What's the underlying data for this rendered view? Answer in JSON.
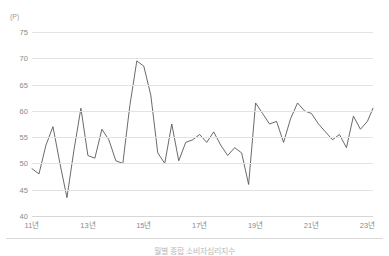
{
  "figure": {
    "caption": "월별 종합 소비자심리지수",
    "background": "#ffffff"
  },
  "axis": {
    "y_unit_label": "(P)",
    "y_ticks": [
      "75",
      "70",
      "65",
      "60",
      "55",
      "50",
      "45",
      "40"
    ],
    "x_ticks": [
      "11년",
      "13년",
      "15년",
      "17년",
      "19년",
      "21년",
      "23년"
    ]
  },
  "colors": {
    "line": "#595959",
    "grid": "#e3e3e3",
    "tick_text": "#8a8a8a",
    "unit_text": "#9a9a9a"
  },
  "chart_data": {
    "type": "line",
    "title": "",
    "xlabel": "",
    "ylabel": "(P)",
    "ylim": [
      40,
      75
    ],
    "xlim": [
      2011.0,
      2023.2
    ],
    "grid": true,
    "legend": "none",
    "y_ticks": [
      40,
      45,
      50,
      55,
      60,
      65,
      70,
      75
    ],
    "x_tick_labels": [
      "11년",
      "13년",
      "15년",
      "17년",
      "19년",
      "21년",
      "23년"
    ],
    "x_tick_values": [
      2011,
      2013,
      2015,
      2017,
      2019,
      2021,
      2023
    ],
    "series": [
      {
        "name": "종합 소비자심리지수",
        "unit": "P",
        "x": [
          2011.0,
          2011.25,
          2011.5,
          2011.75,
          2012.0,
          2012.25,
          2012.5,
          2012.75,
          2013.0,
          2013.25,
          2013.5,
          2013.75,
          2014.0,
          2014.25,
          2014.5,
          2014.75,
          2015.0,
          2015.25,
          2015.5,
          2015.75,
          2016.0,
          2016.25,
          2016.5,
          2016.75,
          2017.0,
          2017.25,
          2017.5,
          2017.75,
          2018.0,
          2018.25,
          2018.5,
          2018.75,
          2019.0,
          2019.25,
          2019.5,
          2019.75,
          2020.0,
          2020.25,
          2020.5,
          2020.75,
          2021.0,
          2021.25,
          2021.5,
          2021.75,
          2022.0,
          2022.25,
          2022.5,
          2022.75,
          2023.0,
          2023.2
        ],
        "values": [
          49.0,
          48.0,
          53.5,
          57.0,
          50.0,
          43.5,
          52.5,
          60.5,
          51.5,
          51.0,
          56.5,
          54.5,
          50.5,
          50.0,
          61.0,
          69.5,
          68.5,
          63.0,
          52.0,
          50.0,
          57.5,
          50.5,
          54.0,
          54.5,
          55.5,
          54.0,
          56.0,
          53.5,
          51.5,
          53.0,
          52.0,
          46.0,
          61.5,
          59.5,
          57.5,
          58.0,
          54.0,
          58.5,
          61.5,
          60.0,
          59.5,
          57.5,
          56.0,
          54.5,
          55.5,
          53.0,
          59.0,
          56.5,
          58.0,
          60.5
        ]
      }
    ]
  }
}
